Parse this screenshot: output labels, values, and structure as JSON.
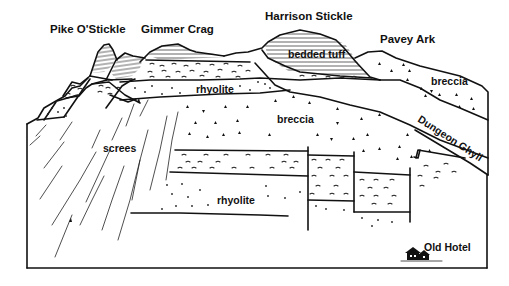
{
  "diagram": {
    "peak_labels": {
      "pike_o_stickle": "Pike O'Stickle",
      "gimmer_crag": "Gimmer Crag",
      "harrison_stickle": "Harrison Stickle",
      "pavey_ark": "Pavey Ark"
    },
    "unit_labels": {
      "bedded_tuff": "bedded tuff",
      "rhyolite_upper": "rhyolite",
      "breccia_right": "breccia",
      "breccia_center": "breccia",
      "screes": "screes",
      "rhyolite_lower": "rhyolite",
      "dungeon_ghyll": "Dungeon Ghyll",
      "old_hotel": "Old Hotel"
    },
    "legend_symbols": {
      "bedded_tuff": "horizontal-hatching",
      "rhyolite": "dots",
      "breccia": "triangles",
      "tuff_layers": "wavy-dashes",
      "screes": "diagonal-lines"
    },
    "colors": {
      "ink": "#111111",
      "paper": "#ffffff"
    }
  }
}
